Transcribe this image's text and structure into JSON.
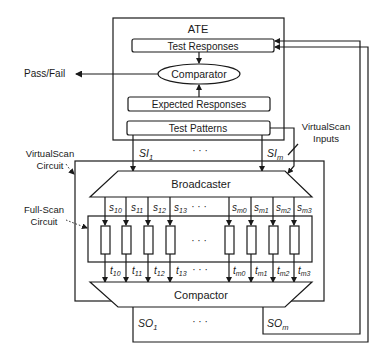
{
  "diagram": {
    "ate": {
      "title": "ATE",
      "test_responses": "Test Responses",
      "comparator": "Comparator",
      "expected_responses": "Expected Responses",
      "test_patterns": "Test Patterns"
    },
    "pass_fail": "Pass/Fail",
    "virtualscan_inputs": {
      "line1": "VirtualScan",
      "line2": "Inputs"
    },
    "virtualscan_circuit": {
      "line1": "VirtualScan",
      "line2": "Circuit"
    },
    "fullscan_circuit": {
      "line1": "Full-Scan",
      "line2": "Circuit"
    },
    "broadcaster": "Broadcaster",
    "compactor": "Compactor",
    "scan_inputs": {
      "first_base": "SI",
      "first_sub": "1",
      "last_base": "SI",
      "last_sub": "m",
      "ellipsis": "· · ·"
    },
    "scan_outputs": {
      "first_base": "SO",
      "first_sub": "1",
      "last_base": "SO",
      "last_sub": "m",
      "ellipsis": "· · ·"
    },
    "chain_inputs": [
      {
        "base": "s",
        "sub": "10"
      },
      {
        "base": "s",
        "sub": "11"
      },
      {
        "base": "s",
        "sub": "12"
      },
      {
        "base": "s",
        "sub": "13"
      },
      {
        "base": "s",
        "sub": "m0"
      },
      {
        "base": "s",
        "sub": "m1"
      },
      {
        "base": "s",
        "sub": "m2"
      },
      {
        "base": "s",
        "sub": "m3"
      }
    ],
    "chain_outputs": [
      {
        "base": "t",
        "sub": "10"
      },
      {
        "base": "t",
        "sub": "11"
      },
      {
        "base": "t",
        "sub": "12"
      },
      {
        "base": "t",
        "sub": "13"
      },
      {
        "base": "t",
        "sub": "m0"
      },
      {
        "base": "t",
        "sub": "m1"
      },
      {
        "base": "t",
        "sub": "m2"
      },
      {
        "base": "t",
        "sub": "m3"
      }
    ],
    "chain_ellipsis": "· · ·"
  }
}
